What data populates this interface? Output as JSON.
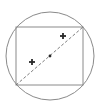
{
  "diagram": {
    "canvas": {
      "width": 100,
      "height": 108
    },
    "colors": {
      "background": "#ffffff",
      "circle_stroke": "#8a8a8a",
      "rect_stroke": "#8a8a8a",
      "diagonal_stroke": "#6e6e6e",
      "marker": "#2a2a2a"
    },
    "circle": {
      "cx": 50,
      "cy": 56,
      "r": 44
    },
    "rectangle": {
      "x": 16,
      "y": 27,
      "width": 67,
      "height": 58
    },
    "diagonal": {
      "x1": 16,
      "y1": 85,
      "x2": 83,
      "y2": 27,
      "dash": "3,2"
    },
    "center_point": {
      "cx": 50,
      "cy": 56,
      "r": 1.4
    },
    "plus_markers": [
      {
        "cx": 63,
        "cy": 36,
        "symbol": "+"
      },
      {
        "cx": 32,
        "cy": 62,
        "symbol": "+"
      }
    ]
  }
}
